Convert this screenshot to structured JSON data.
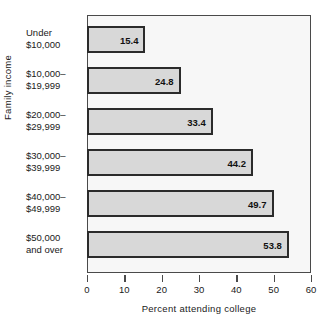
{
  "chart_data": {
    "type": "bar",
    "orientation": "horizontal",
    "title": "",
    "xlabel": "Percent attending college",
    "ylabel": "Family income",
    "categories": [
      "Under $10,000",
      "$10,000–$19,999",
      "$20,000–$29,999",
      "$30,000–$39,999",
      "$40,000–$49,999",
      "$50,000 and over"
    ],
    "category_lines": [
      [
        "Under",
        "$10,000"
      ],
      [
        "$10,000–",
        "$19,999"
      ],
      [
        "$20,000–",
        "$29,999"
      ],
      [
        "$30,000–",
        "$39,999"
      ],
      [
        "$40,000–",
        "$49,999"
      ],
      [
        "$50,000",
        "and over"
      ]
    ],
    "values": [
      15.4,
      24.8,
      33.4,
      44.2,
      49.7,
      53.8
    ],
    "value_labels": [
      "15.4",
      "24.8",
      "33.4",
      "44.2",
      "49.7",
      "53.8"
    ],
    "xlim": [
      0,
      60
    ],
    "xticks": [
      0,
      10,
      20,
      30,
      40,
      50,
      60
    ],
    "xtick_labels": [
      "0",
      "10",
      "20",
      "30",
      "40",
      "50",
      "60"
    ],
    "grid": false,
    "legend": null,
    "colors": {
      "bar_fill": "#d8d8d8",
      "bar_edge": "#2b2b2b",
      "plot_background": "#f7f7f7",
      "axis_line": "#4a4a4a",
      "text": "#1a1a1a"
    }
  }
}
